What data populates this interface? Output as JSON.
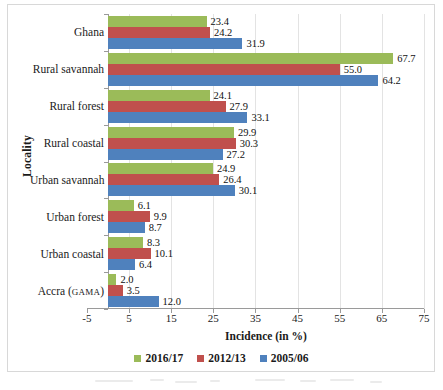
{
  "chart_data": {
    "type": "bar",
    "orientation": "horizontal",
    "title": "",
    "xlabel": "Incidence (in %)",
    "ylabel": "Locality",
    "xlim": [
      -5,
      75
    ],
    "xticks": [
      -5,
      5,
      15,
      25,
      35,
      45,
      55,
      65,
      75
    ],
    "grid": true,
    "grid_axis": "x",
    "legend_position": "bottom",
    "categories": [
      "Ghana",
      "Rural savannah",
      "Rural forest",
      "Rural coastal",
      "Urban savannah",
      "Urban forest",
      "Urban coastal",
      "Accra (GAMA)"
    ],
    "series": [
      {
        "name": "2016/17",
        "color": "#9BBB59",
        "values": [
          23.4,
          67.7,
          24.1,
          29.9,
          24.9,
          6.1,
          8.3,
          2.0
        ],
        "labels": [
          "23.4",
          "67.7",
          "24.1",
          "29.9",
          "24.9",
          "6.1",
          "8.3",
          "2.0"
        ]
      },
      {
        "name": "2012/13",
        "color": "#C0504D",
        "values": [
          24.2,
          55.0,
          27.9,
          30.3,
          26.4,
          9.9,
          10.1,
          3.5
        ],
        "labels": [
          "24.2",
          "55.0",
          "27.9",
          "30.3",
          "26.4",
          "9.9",
          "10.1",
          "3.5"
        ]
      },
      {
        "name": "2005/06",
        "color": "#4F81BD",
        "values": [
          31.9,
          64.2,
          33.1,
          27.2,
          30.1,
          8.7,
          6.4,
          12.0
        ],
        "labels": [
          "31.9",
          "64.2",
          "33.1",
          "27.2",
          "30.1",
          "8.7",
          "6.4",
          "12.0"
        ]
      }
    ]
  },
  "axis": {
    "y_title": "Locality",
    "x_title": "Incidence (in %)",
    "x_tick_labels": [
      "-5",
      "5",
      "15",
      "25",
      "35",
      "45",
      "55",
      "65",
      "75"
    ]
  },
  "category_labels": [
    {
      "main": "Ghana",
      "suffix": ""
    },
    {
      "main": "Rural savannah",
      "suffix": ""
    },
    {
      "main": "Rural forest",
      "suffix": ""
    },
    {
      "main": "Rural coastal",
      "suffix": ""
    },
    {
      "main": "Urban savannah",
      "suffix": ""
    },
    {
      "main": "Urban forest",
      "suffix": ""
    },
    {
      "main": "Urban coastal",
      "suffix": ""
    },
    {
      "main": "Accra (",
      "suffix": "GAMA",
      "tail": ")"
    }
  ],
  "legend": {
    "items": [
      {
        "label": "2016/17",
        "color": "#9BBB59"
      },
      {
        "label": "2012/13",
        "color": "#C0504D"
      },
      {
        "label": "2005/06",
        "color": "#4F81BD"
      }
    ]
  },
  "colors": {
    "series_2016_17": "#9BBB59",
    "series_2012_13": "#C0504D",
    "series_2005_06": "#4F81BD",
    "gridline": "#e3e3e3",
    "axis": "#9a9a9a",
    "frame": "#d8d8d8",
    "background": "#ffffff"
  }
}
